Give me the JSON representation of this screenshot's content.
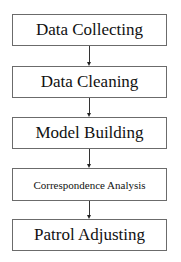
{
  "flowchart": {
    "steps": [
      {
        "label": "Data Collecting"
      },
      {
        "label": "Data Cleaning"
      },
      {
        "label": "Model Building"
      },
      {
        "label": "Correspondence Analysis"
      },
      {
        "label": "Patrol Adjusting"
      }
    ],
    "colors": {
      "border": "#6b6b6b",
      "arrow": "#333333",
      "text": "#111111",
      "background": "#ffffff"
    }
  }
}
